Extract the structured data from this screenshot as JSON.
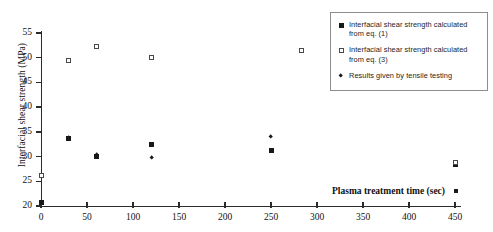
{
  "chart_data": {
    "type": "scatter",
    "title": "",
    "xlabel": "Plasma treatment time (sec)",
    "ylabel": "Interfacial shear strength (MPa)",
    "xlim": [
      0,
      450
    ],
    "ylim": [
      20,
      55
    ],
    "xticks": [
      0,
      50,
      100,
      150,
      200,
      250,
      300,
      350,
      400,
      450
    ],
    "yticks": [
      20,
      25,
      30,
      35,
      40,
      45,
      50,
      55
    ],
    "grid": false,
    "legend_position": "top-right",
    "series": [
      {
        "name": "Interfacial shear strength calculated from eq. (1)",
        "marker": "filled-square",
        "points": [
          {
            "x": 0,
            "y": 20.8
          },
          {
            "x": 30,
            "y": 33.6
          },
          {
            "x": 60,
            "y": 30.1
          },
          {
            "x": 120,
            "y": 32.5
          },
          {
            "x": 250,
            "y": 31.3
          },
          {
            "x": 450,
            "y": 28.3
          }
        ]
      },
      {
        "name": "Interfacial shear strength calculated from eq. (3)",
        "marker": "open-square",
        "points": [
          {
            "x": 0,
            "y": 26.1
          },
          {
            "x": 30,
            "y": 49.4
          },
          {
            "x": 60,
            "y": 52.2
          },
          {
            "x": 120,
            "y": 50.0
          },
          {
            "x": 283,
            "y": 51.5
          },
          {
            "x": 450,
            "y": 28.7
          }
        ]
      },
      {
        "name": "Results given by tensile testing",
        "marker": "diamond",
        "points": [
          {
            "x": 30,
            "y": 33.9
          },
          {
            "x": 60,
            "y": 30.4
          },
          {
            "x": 120,
            "y": 29.8
          },
          {
            "x": 250,
            "y": 34.0
          }
        ]
      }
    ]
  },
  "legend": {
    "entries": [
      {
        "marker": "filled-square",
        "line1": "Interfacial shear strength calculated",
        "line2": "from eq. (1)"
      },
      {
        "marker": "open-square",
        "line1": "Interfacial shear strength calculated",
        "line2": "from eq. (3)"
      },
      {
        "marker": "diamond",
        "line1": "Results given by tensile testing",
        "line2": ""
      }
    ]
  },
  "colors": {
    "axis": "#2b2b2b",
    "marker_fill": "#181818",
    "marker_open_border": "#4a4a4a",
    "legend_border": "#8d8d8d",
    "background": "#ffffff"
  }
}
